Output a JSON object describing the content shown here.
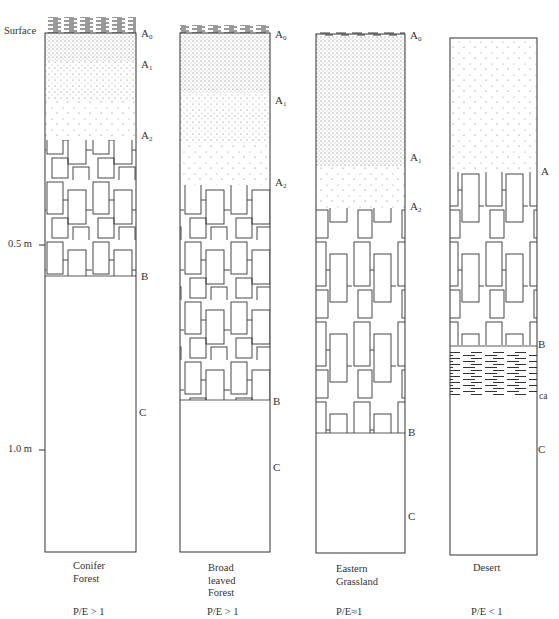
{
  "diagram": {
    "type": "soil-profile-comparison",
    "depth_axis": {
      "surface_label": "Surface",
      "ticks": [
        {
          "label": "0.5 m",
          "y": 245
        },
        {
          "label": "1.0 m",
          "y": 450
        }
      ]
    },
    "profiles": [
      {
        "id": "conifer",
        "caption": [
          "Conifer",
          "Forest"
        ],
        "pe_ratio": "P/E > 1",
        "horizons": [
          {
            "label": "A",
            "sub": "0",
            "y": 17
          },
          {
            "label": "A",
            "sub": "1",
            "y": 58
          },
          {
            "label": "A",
            "sub": "2",
            "y": 134
          },
          {
            "label": "B",
            "sub": "",
            "y": 272
          },
          {
            "label": "C",
            "sub": "",
            "y": 407
          }
        ]
      },
      {
        "id": "broadleaf",
        "caption": [
          "Broad",
          "leaved",
          "Forest"
        ],
        "pe_ratio": "P/E > 1",
        "horizons": [
          {
            "label": "A",
            "sub": "0",
            "y": 27
          },
          {
            "label": "A",
            "sub": "1",
            "y": 92
          },
          {
            "label": "A",
            "sub": "2",
            "y": 176
          },
          {
            "label": "B",
            "sub": "",
            "y": 396
          },
          {
            "label": "C",
            "sub": "",
            "y": 461
          }
        ]
      },
      {
        "id": "grassland",
        "caption": [
          "Eastern",
          "Grassland"
        ],
        "pe_ratio": "P/E≈1",
        "horizons": [
          {
            "label": "A",
            "sub": "0",
            "y": 29
          },
          {
            "label": "A",
            "sub": "1",
            "y": 150
          },
          {
            "label": "A",
            "sub": "2",
            "y": 200
          },
          {
            "label": "B",
            "sub": "",
            "y": 424
          },
          {
            "label": "C",
            "sub": "",
            "y": 508
          }
        ]
      },
      {
        "id": "desert",
        "caption": [
          "Desert"
        ],
        "pe_ratio": "P/E < 1",
        "horizons": [
          {
            "label": "A",
            "sub": "",
            "y": 164
          },
          {
            "label": "B",
            "sub": "",
            "y": 337
          },
          {
            "label": "ca",
            "sub": "",
            "y": 389
          },
          {
            "label": "C",
            "sub": "",
            "y": 442
          }
        ]
      }
    ]
  }
}
